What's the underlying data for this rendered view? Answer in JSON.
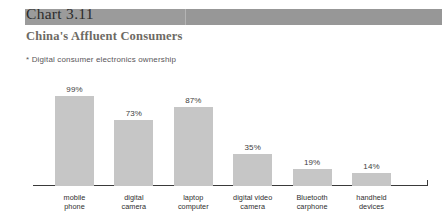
{
  "header": {
    "chart_number": "Chart 3.11",
    "subtitle": "China's Affluent Consumers",
    "note": "* Digital consumer electronics ownership",
    "band_color": "#9b9b9b"
  },
  "chart_data": {
    "type": "bar",
    "title": "China's Affluent Consumers",
    "subtitle": "* Digital consumer electronics ownership",
    "xlabel": "",
    "ylabel": "",
    "ylim": [
      0,
      100
    ],
    "grid": false,
    "legend": "none",
    "bar_color": "#c6c6c6",
    "categories": [
      "mobile phone",
      "digital camera",
      "laptop computer",
      "digital video camera",
      "Bluetooth carphone",
      "handheld devices"
    ],
    "category_lines": [
      [
        "mobile",
        "phone"
      ],
      [
        "digital",
        "camera"
      ],
      [
        "laptop",
        "computer"
      ],
      [
        "digital video",
        "camera"
      ],
      [
        "Bluetooth",
        "carphone"
      ],
      [
        "handheld",
        "devices"
      ]
    ],
    "values": [
      99,
      73,
      87,
      35,
      19,
      14
    ],
    "value_labels": [
      "99%",
      "73%",
      "87%",
      "35%",
      "19%",
      "14%"
    ]
  }
}
